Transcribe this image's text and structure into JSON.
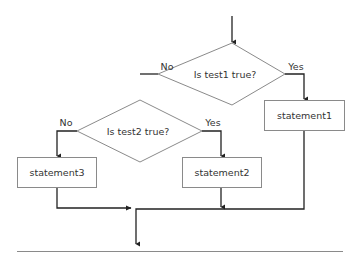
{
  "diagram": {
    "type": "flowchart",
    "decisions": [
      {
        "id": "decision1",
        "text": "Is test1 true?",
        "yes_label": "Yes",
        "no_label": "No"
      },
      {
        "id": "decision2",
        "text": "Is test2 true?",
        "yes_label": "Yes",
        "no_label": "No"
      }
    ],
    "statements": [
      {
        "id": "statement1",
        "text": "statement1"
      },
      {
        "id": "statement2",
        "text": "statement2"
      },
      {
        "id": "statement3",
        "text": "statement3"
      }
    ],
    "edges": [
      {
        "from": "entry",
        "to": "decision1"
      },
      {
        "from": "decision1",
        "to": "statement1",
        "label": "Yes"
      },
      {
        "from": "decision1",
        "to": "decision2",
        "label": "No"
      },
      {
        "from": "decision2",
        "to": "statement2",
        "label": "Yes"
      },
      {
        "from": "decision2",
        "to": "statement3",
        "label": "No"
      },
      {
        "from": "statement1",
        "to": "exit"
      },
      {
        "from": "statement2",
        "to": "exit"
      },
      {
        "from": "statement3",
        "to": "exit"
      }
    ],
    "colors": {
      "line": "#333333",
      "shape_border": "#8a8a8a",
      "text": "#333333",
      "separator": "#8a8a8a"
    }
  }
}
